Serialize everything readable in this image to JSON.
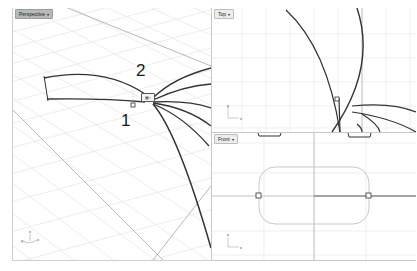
{
  "app": {
    "type": "3D modeling viewports",
    "background": "#ffffff",
    "grid_color": "#d8d8d8",
    "grid_axis_color": "#a8a8a8",
    "curve_color": "#333333",
    "rect_curve_color": "#c9c9c9"
  },
  "viewports": [
    {
      "id": "perspective",
      "title": "Perspective",
      "menu_caret": "▾",
      "annotations": [
        {
          "text": "1",
          "x": 121,
          "y": 112
        },
        {
          "text": "2",
          "x": 136,
          "y": 62
        }
      ],
      "gumball_label": "▦▫",
      "axis_widget": {
        "z": "z",
        "y": "y",
        "x": "x"
      }
    },
    {
      "id": "top",
      "title": "Top",
      "menu_caret": "▾",
      "axis_widget": {
        "vertical": "y",
        "horizontal": "x"
      }
    },
    {
      "id": "front",
      "title": "Front",
      "menu_caret": "▾",
      "axis_widget": {
        "vertical": "z",
        "horizontal": "x"
      }
    }
  ]
}
